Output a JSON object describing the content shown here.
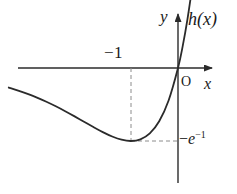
{
  "figure": {
    "width": 237,
    "height": 194,
    "background_color": "#ffffff",
    "stroke_color": "#2b2b2b",
    "dash_color": "#8c8c8c"
  },
  "labels": {
    "y_axis": "y",
    "x_axis": "x",
    "origin": "O",
    "function_name": "h(x)",
    "x_min_tick": "−1",
    "y_min_value_prefix": "−",
    "y_min_value_base": "e",
    "y_min_value_exponent": "−1",
    "y_min_value_full": "−e⁻¹"
  },
  "chart_data": {
    "type": "line",
    "title": "",
    "xlabel": "x",
    "ylabel": "y",
    "function": "h(x) = x·e^x",
    "grid": false,
    "legend": null,
    "axis_style": "arrowed-cartesian",
    "xlim": [
      -3.6,
      0.45
    ],
    "ylim": [
      -0.62,
      0.62
    ],
    "annotations": [
      {
        "text": "h(x)",
        "role": "curve-label",
        "x": 0.3,
        "y": 0.55
      },
      {
        "text": "y",
        "role": "axis-label",
        "x": -0.1,
        "y": 0.6
      },
      {
        "text": "x",
        "role": "axis-label",
        "x": 0.4,
        "y": -0.06
      },
      {
        "text": "O",
        "role": "origin-label",
        "x": 0.04,
        "y": -0.07
      },
      {
        "text": "−1",
        "role": "x-tick-label",
        "x": -1.0,
        "y": 0.2
      },
      {
        "text": "−e⁻¹",
        "role": "y-tick-label",
        "x": 0.06,
        "y": -0.3679
      }
    ],
    "guides": [
      {
        "type": "dashed-vertical",
        "x": -1.0,
        "from_y": 0.0,
        "to_y": -0.3679
      },
      {
        "type": "dashed-horizontal",
        "y": -0.3679,
        "from_x": -1.0,
        "to_x": 0.0
      }
    ],
    "key_points": [
      {
        "name": "minimum",
        "x": -1.0,
        "y": -0.3679,
        "label": "(−1, −e⁻¹)"
      },
      {
        "name": "origin-crossing",
        "x": 0.0,
        "y": 0.0,
        "label": "O"
      }
    ],
    "series": [
      {
        "name": "h(x)",
        "points": [
          [
            -3.6,
            -0.0985
          ],
          [
            -3.4,
            -0.1136
          ],
          [
            -3.2,
            -0.1304
          ],
          [
            -3.0,
            -0.1494
          ],
          [
            -2.8,
            -0.1703
          ],
          [
            -2.6,
            -0.1931
          ],
          [
            -2.4,
            -0.2177
          ],
          [
            -2.2,
            -0.2438
          ],
          [
            -2.0,
            -0.2707
          ],
          [
            -1.8,
            -0.2975
          ],
          [
            -1.6,
            -0.323
          ],
          [
            -1.4,
            -0.3452
          ],
          [
            -1.2,
            -0.3614
          ],
          [
            -1.0,
            -0.3679
          ],
          [
            -0.8,
            -0.3595
          ],
          [
            -0.6,
            -0.3293
          ],
          [
            -0.4,
            -0.2681
          ],
          [
            -0.2,
            -0.1637
          ],
          [
            0.0,
            0.0
          ],
          [
            0.1,
            0.1105
          ],
          [
            0.2,
            0.2443
          ],
          [
            0.3,
            0.405
          ],
          [
            0.36,
            0.5163
          ]
        ]
      }
    ]
  }
}
